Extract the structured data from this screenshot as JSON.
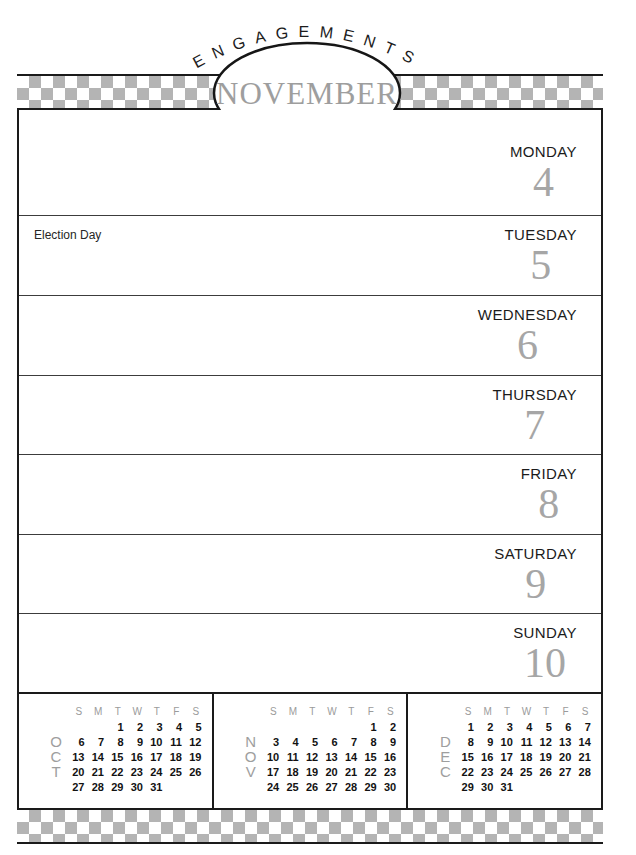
{
  "title_banner": {
    "arc_text": "ENGAGEMENTS",
    "month": "NOVEMBER",
    "year": "1985"
  },
  "week": [
    {
      "day": "MONDAY",
      "date": "4",
      "note": ""
    },
    {
      "day": "TUESDAY",
      "date": "5",
      "note": "Election Day"
    },
    {
      "day": "WEDNESDAY",
      "date": "6",
      "note": ""
    },
    {
      "day": "THURSDAY",
      "date": "7",
      "note": ""
    },
    {
      "day": "FRIDAY",
      "date": "8",
      "note": ""
    },
    {
      "day": "SATURDAY",
      "date": "9",
      "note": ""
    },
    {
      "day": "SUNDAY",
      "date": "10",
      "note": ""
    }
  ],
  "mini_calendars": {
    "weekday_headers": [
      "S",
      "M",
      "T",
      "W",
      "T",
      "F",
      "S"
    ],
    "months": [
      {
        "name": "OCT",
        "letters": [
          "O",
          "C",
          "T"
        ],
        "weeks": [
          [
            "",
            "",
            "1",
            "2",
            "3",
            "4",
            "5"
          ],
          [
            "6",
            "7",
            "8",
            "9",
            "10",
            "11",
            "12"
          ],
          [
            "13",
            "14",
            "15",
            "16",
            "17",
            "18",
            "19"
          ],
          [
            "20",
            "21",
            "22",
            "23",
            "24",
            "25",
            "26"
          ],
          [
            "27",
            "28",
            "29",
            "30",
            "31",
            "",
            ""
          ]
        ]
      },
      {
        "name": "NOV",
        "letters": [
          "N",
          "O",
          "V"
        ],
        "weeks": [
          [
            "",
            "",
            "",
            "",
            "",
            "1",
            "2"
          ],
          [
            "3",
            "4",
            "5",
            "6",
            "7",
            "8",
            "9"
          ],
          [
            "10",
            "11",
            "12",
            "13",
            "14",
            "15",
            "16"
          ],
          [
            "17",
            "18",
            "19",
            "20",
            "21",
            "22",
            "23"
          ],
          [
            "24",
            "25",
            "26",
            "27",
            "28",
            "29",
            "30"
          ]
        ]
      },
      {
        "name": "DEC",
        "letters": [
          "D",
          "E",
          "C"
        ],
        "weeks": [
          [
            "1",
            "2",
            "3",
            "4",
            "5",
            "6",
            "7"
          ],
          [
            "8",
            "9",
            "10",
            "11",
            "12",
            "13",
            "14"
          ],
          [
            "15",
            "16",
            "17",
            "18",
            "19",
            "20",
            "21"
          ],
          [
            "22",
            "23",
            "24",
            "25",
            "26",
            "27",
            "28"
          ],
          [
            "29",
            "30",
            "31",
            "",
            "",
            "",
            ""
          ]
        ]
      }
    ]
  },
  "colors": {
    "checker-gray": "#b4b4b4",
    "month-gray": "#9e9e9e",
    "numeral-gray": "#a6a6a6",
    "header-gray": "#9b9b9b",
    "line-black": "#1a1a1a",
    "text-black": "#1c1c1c"
  }
}
